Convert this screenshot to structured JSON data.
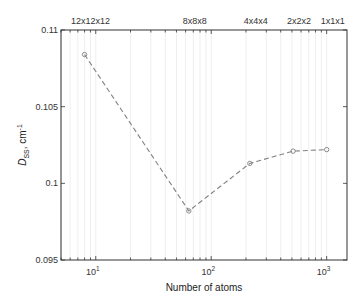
{
  "chart_data": {
    "type": "line",
    "title": "",
    "xlabel": "Number of atoms",
    "ylabel": {
      "main": "D",
      "sub": "SS",
      "unit": ", cm",
      "sup": "-1"
    },
    "xscale": "log",
    "xlim": [
      5,
      1500
    ],
    "ylim": [
      0.095,
      0.11
    ],
    "yticks": [
      0.095,
      0.1,
      0.105,
      0.11
    ],
    "ytick_labels": [
      "0.095",
      "0.1",
      "0.105",
      "0.11"
    ],
    "xticks": [
      10,
      100,
      1000
    ],
    "xtick_labels": [
      {
        "base": "10",
        "exp": "1"
      },
      {
        "base": "10",
        "exp": "2"
      },
      {
        "base": "10",
        "exp": "3"
      }
    ],
    "top_axis_labels": [
      {
        "x": 8,
        "label": "12x12x12"
      },
      {
        "x": 64,
        "label": "8x8x8"
      },
      {
        "x": 216,
        "label": "4x4x4"
      },
      {
        "x": 512,
        "label": "2x2x2"
      },
      {
        "x": 1000,
        "label": "1x1x1"
      }
    ],
    "grid": "vertical-minor",
    "series": [
      {
        "name": "D_SS",
        "line_style": "dashed",
        "marker": "circle",
        "color": "#808080",
        "x": [
          8,
          64,
          216,
          512,
          1000
        ],
        "y": [
          0.1084,
          0.0982,
          0.1013,
          0.1021,
          0.1022
        ]
      }
    ]
  }
}
